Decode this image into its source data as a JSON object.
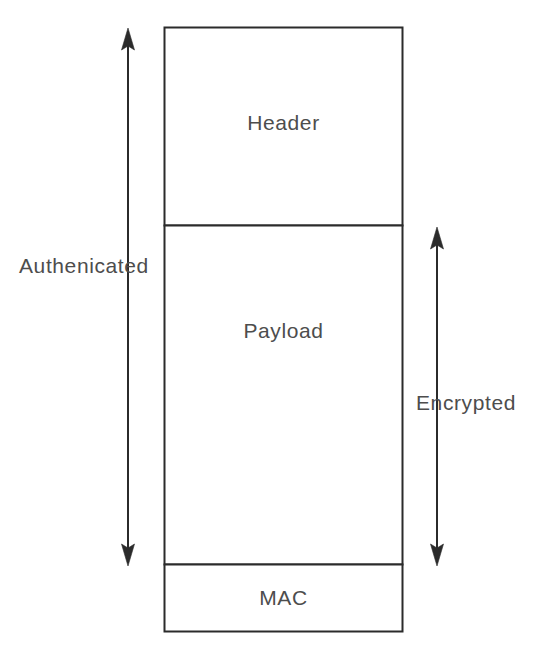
{
  "diagram": {
    "background_color": "#ffffff",
    "stroke_color": "#2b2b2b",
    "text_color": "#4d4d4d",
    "packet": {
      "fields": [
        {
          "name": "header",
          "label": "Header"
        },
        {
          "name": "payload",
          "label": "Payload"
        },
        {
          "name": "mac",
          "label": "MAC"
        }
      ]
    },
    "annotations": [
      {
        "name": "authenticated",
        "label": "Authenicated",
        "side": "left",
        "spans": [
          "Header",
          "Payload"
        ],
        "arrow": "double-headed-vertical"
      },
      {
        "name": "encrypted",
        "label": "Encrypted",
        "side": "right",
        "spans": [
          "Payload"
        ],
        "arrow": "double-headed-vertical"
      }
    ]
  }
}
